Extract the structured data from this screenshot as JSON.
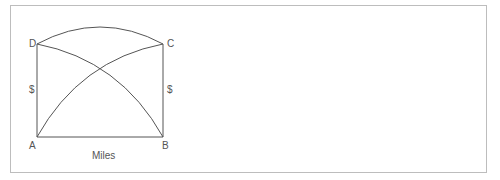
{
  "diagram": {
    "points": {
      "A": {
        "label": "A",
        "x": 37,
        "y": 137
      },
      "B": {
        "label": "B",
        "x": 162,
        "y": 137
      },
      "C": {
        "label": "C",
        "x": 163,
        "y": 44
      },
      "D": {
        "label": "D",
        "x": 37,
        "y": 44
      }
    },
    "axis_labels": {
      "left": "$",
      "right": "$",
      "bottom": "Miles"
    },
    "edges": [
      {
        "from": "A",
        "to": "B",
        "type": "line"
      },
      {
        "from": "A",
        "to": "D",
        "type": "line"
      },
      {
        "from": "B",
        "to": "C",
        "type": "line"
      },
      {
        "from": "D",
        "to": "C",
        "type": "arc"
      },
      {
        "from": "A",
        "to": "C",
        "type": "curve"
      },
      {
        "from": "D",
        "to": "B",
        "type": "curve"
      }
    ],
    "stroke_color": "#555555",
    "frame_color": "#bdbdbd"
  }
}
